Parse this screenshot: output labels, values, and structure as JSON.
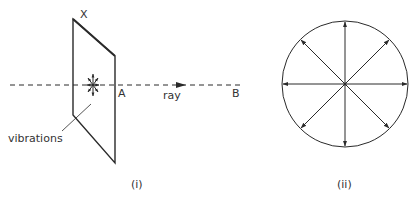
{
  "figure_i": {
    "caption": "(i)",
    "label_top_corner": "X",
    "label_point_a": "A",
    "label_ray": "ray",
    "label_point_b": "B",
    "label_vibrations": "vibrations"
  },
  "figure_ii": {
    "caption": "(ii)",
    "arrow_directions_deg": [
      0,
      45,
      90,
      135,
      180,
      225,
      270,
      315
    ]
  },
  "colors": {
    "line": "#2a2a2a",
    "text": "#333333",
    "background": "#ffffff"
  }
}
